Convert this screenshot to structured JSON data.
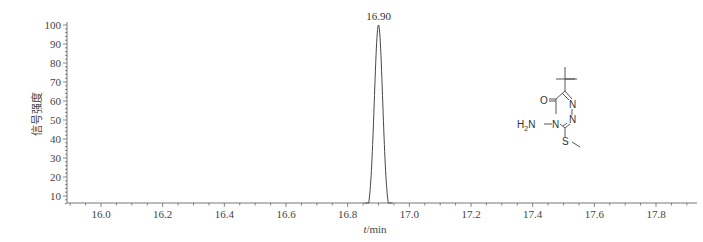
{
  "chart_data": {
    "type": "line",
    "title": "",
    "xlabel_italic": "t",
    "xlabel_rest": "/min",
    "xlabel": "t/min",
    "ylabel": "信号强度",
    "xlim": [
      15.9,
      17.92
    ],
    "ylim": [
      5,
      100
    ],
    "grid": false,
    "legend": null,
    "x_ticks": [
      "16.0",
      "16.2",
      "16.4",
      "16.6",
      "16.8",
      "17.0",
      "17.2",
      "17.4",
      "17.6",
      "17.8"
    ],
    "y_ticks": [
      "10",
      "20",
      "30",
      "40",
      "50",
      "60",
      "70",
      "80",
      "90",
      "100"
    ],
    "series": [
      {
        "name": "chromatogram",
        "x": [
          15.9,
          16.86,
          16.87,
          16.88,
          16.89,
          16.9,
          16.91,
          16.92,
          16.93,
          16.94,
          17.92
        ],
        "y": [
          5,
          5,
          25,
          62,
          92,
          100,
          92,
          62,
          25,
          5,
          5
        ]
      }
    ],
    "annotations": [
      {
        "text": "16.90",
        "x": 16.9,
        "y": 100,
        "type": "peak-label"
      }
    ],
    "inset": {
      "type": "chemical-structure",
      "labels": [
        "O",
        "N",
        "N",
        "N",
        "H2N",
        "S"
      ]
    }
  },
  "structure": {
    "o_label": "O",
    "n1_label": "N",
    "n2_label": "N",
    "n4_label": "N",
    "nh2_h": "H",
    "nh2_sub": "2",
    "nh2_n": "N",
    "s_label": "S"
  }
}
